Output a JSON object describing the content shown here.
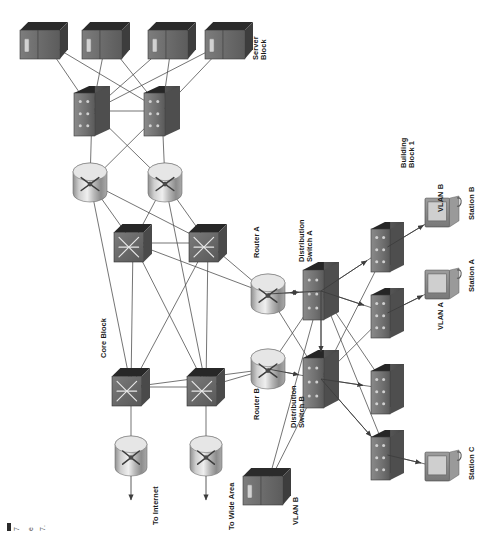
{
  "diagram": {
    "type": "network-topology",
    "orientation": "rotated-90-ccw",
    "background": "#ffffff"
  },
  "palette": {
    "device_dark": "#3f3f3f",
    "device_top": "#2a2a2a",
    "device_face": "#6e6e6e",
    "device_side": "#555555",
    "router_light": "#d8d8d8",
    "router_mid": "#9a9a9a",
    "router_dark": "#6a6a6a",
    "line": "#4a4a4a",
    "text": "#1a1a1a",
    "screen": "#c9c9c9"
  },
  "labels": [
    {
      "id": "server-block",
      "text_line1": "Server",
      "text_line2": "Block",
      "x": 252,
      "y": 60
    },
    {
      "id": "core-block",
      "text_line1": "Core Block",
      "text_line2": "",
      "x": 100,
      "y": 358
    },
    {
      "id": "to-internet",
      "text_line1": "To Internet",
      "text_line2": "",
      "x": 152,
      "y": 525
    },
    {
      "id": "to-wide-area",
      "text_line1": "To Wide Area",
      "text_line2": "",
      "x": 228,
      "y": 530
    },
    {
      "id": "router-a",
      "text_line1": "Router A",
      "text_line2": "",
      "x": 253,
      "y": 258
    },
    {
      "id": "distribution-switch-a",
      "text_line1": "Distribution",
      "text_line2": "Switch A",
      "x": 298,
      "y": 262
    },
    {
      "id": "router-b",
      "text_line1": "Router B",
      "text_line2": "",
      "x": 253,
      "y": 420
    },
    {
      "id": "distribution-switch-b",
      "text_line1": "Distribution",
      "text_line2": "Switch B",
      "x": 290,
      "y": 428
    },
    {
      "id": "building-block-1",
      "text_line1": "Building",
      "text_line2": "Block 1",
      "x": 400,
      "y": 168
    },
    {
      "id": "vlan-a",
      "text_line1": "VLAN A",
      "text_line2": "",
      "x": 437,
      "y": 330
    },
    {
      "id": "vlan-b-top",
      "text_line1": "VLAN B",
      "text_line2": "",
      "x": 437,
      "y": 212
    },
    {
      "id": "vlan-b-bottom",
      "text_line1": "VLAN B",
      "text_line2": "",
      "x": 292,
      "y": 525
    },
    {
      "id": "station-a",
      "text_line1": "Station A",
      "text_line2": "",
      "x": 468,
      "y": 292
    },
    {
      "id": "station-b",
      "text_line1": "Station B",
      "text_line2": "",
      "x": 468,
      "y": 220
    },
    {
      "id": "station-c",
      "text_line1": "Station C",
      "text_line2": "",
      "x": 468,
      "y": 480
    }
  ],
  "nodes": [
    {
      "id": "srv1",
      "kind": "server",
      "name": "server-block-server-1",
      "x": 20,
      "y": 22,
      "w": 48,
      "h": 37
    },
    {
      "id": "srv2",
      "kind": "server",
      "name": "server-block-server-2",
      "x": 82,
      "y": 22,
      "w": 48,
      "h": 37
    },
    {
      "id": "srv3",
      "kind": "server",
      "name": "server-block-server-3",
      "x": 148,
      "y": 22,
      "w": 48,
      "h": 37
    },
    {
      "id": "srv4",
      "kind": "server",
      "name": "server-block-server-4",
      "x": 205,
      "y": 22,
      "w": 48,
      "h": 37
    },
    {
      "id": "sw1",
      "kind": "switch",
      "name": "server-block-switch-1",
      "x": 74,
      "y": 86,
      "w": 36,
      "h": 50
    },
    {
      "id": "sw2",
      "kind": "switch",
      "name": "server-block-switch-2",
      "x": 144,
      "y": 86,
      "w": 36,
      "h": 50
    },
    {
      "id": "rt1",
      "kind": "router",
      "name": "server-block-router-1",
      "x": 73,
      "y": 163,
      "w": 34,
      "h": 39
    },
    {
      "id": "rt2",
      "kind": "router",
      "name": "server-block-router-2",
      "x": 148,
      "y": 163,
      "w": 34,
      "h": 39
    },
    {
      "id": "cs1",
      "kind": "coreswitch",
      "name": "core-switch-1",
      "x": 114,
      "y": 224,
      "w": 38,
      "h": 38
    },
    {
      "id": "cs2",
      "kind": "coreswitch",
      "name": "core-switch-2",
      "x": 189,
      "y": 224,
      "w": 38,
      "h": 38
    },
    {
      "id": "cs3",
      "kind": "coreswitch",
      "name": "core-switch-3",
      "x": 112,
      "y": 368,
      "w": 38,
      "h": 38
    },
    {
      "id": "cs4",
      "kind": "coreswitch",
      "name": "core-switch-4",
      "x": 187,
      "y": 368,
      "w": 38,
      "h": 38
    },
    {
      "id": "er1",
      "kind": "router",
      "name": "edge-router-internet",
      "x": 115,
      "y": 436,
      "w": 32,
      "h": 40
    },
    {
      "id": "er2",
      "kind": "router",
      "name": "edge-router-wide-area",
      "x": 190,
      "y": 436,
      "w": 32,
      "h": 40
    },
    {
      "id": "ra",
      "kind": "router",
      "name": "router-a",
      "x": 251,
      "y": 274,
      "w": 34,
      "h": 40
    },
    {
      "id": "rb",
      "kind": "router",
      "name": "router-b",
      "x": 251,
      "y": 349,
      "w": 34,
      "h": 40
    },
    {
      "id": "dsa",
      "kind": "switch",
      "name": "distribution-switch-a",
      "x": 303,
      "y": 262,
      "w": 36,
      "h": 58
    },
    {
      "id": "dsb",
      "kind": "switch",
      "name": "distribution-switch-b",
      "x": 303,
      "y": 350,
      "w": 36,
      "h": 58
    },
    {
      "id": "as1",
      "kind": "switch",
      "name": "access-switch-1",
      "x": 371,
      "y": 222,
      "w": 33,
      "h": 50
    },
    {
      "id": "as2",
      "kind": "switch",
      "name": "access-switch-2",
      "x": 371,
      "y": 288,
      "w": 33,
      "h": 50
    },
    {
      "id": "as3",
      "kind": "switch",
      "name": "access-switch-3",
      "x": 371,
      "y": 364,
      "w": 33,
      "h": 50
    },
    {
      "id": "as4",
      "kind": "switch",
      "name": "access-switch-4",
      "x": 371,
      "y": 430,
      "w": 33,
      "h": 50
    },
    {
      "id": "stA",
      "kind": "station",
      "name": "station-a",
      "x": 425,
      "y": 268,
      "w": 34,
      "h": 36
    },
    {
      "id": "stB",
      "kind": "station",
      "name": "station-b",
      "x": 425,
      "y": 196,
      "w": 34,
      "h": 36
    },
    {
      "id": "stC",
      "kind": "station",
      "name": "station-c",
      "x": 425,
      "y": 450,
      "w": 34,
      "h": 36
    },
    {
      "id": "vsrv",
      "kind": "server",
      "name": "vlan-b-server",
      "x": 243,
      "y": 468,
      "w": 48,
      "h": 37
    }
  ],
  "links": [
    {
      "from": "srv1",
      "to": "sw1"
    },
    {
      "from": "srv1",
      "to": "sw2"
    },
    {
      "from": "srv2",
      "to": "sw1"
    },
    {
      "from": "srv2",
      "to": "sw2"
    },
    {
      "from": "srv3",
      "to": "sw1"
    },
    {
      "from": "srv3",
      "to": "sw2"
    },
    {
      "from": "srv4",
      "to": "sw1"
    },
    {
      "from": "srv4",
      "to": "sw2"
    },
    {
      "from": "sw1",
      "to": "sw2"
    },
    {
      "from": "sw1",
      "to": "rt1"
    },
    {
      "from": "sw1",
      "to": "rt2"
    },
    {
      "from": "sw2",
      "to": "rt1"
    },
    {
      "from": "sw2",
      "to": "rt2"
    },
    {
      "from": "rt1",
      "to": "cs1"
    },
    {
      "from": "rt1",
      "to": "cs2"
    },
    {
      "from": "rt2",
      "to": "cs1"
    },
    {
      "from": "rt2",
      "to": "cs2"
    },
    {
      "from": "rt1",
      "to": "cs3"
    },
    {
      "from": "rt2",
      "to": "cs4"
    },
    {
      "from": "cs1",
      "to": "cs2"
    },
    {
      "from": "cs3",
      "to": "cs4"
    },
    {
      "from": "cs1",
      "to": "cs3"
    },
    {
      "from": "cs1",
      "to": "cs4"
    },
    {
      "from": "cs2",
      "to": "cs3"
    },
    {
      "from": "cs2",
      "to": "cs4"
    },
    {
      "from": "cs3",
      "to": "er1"
    },
    {
      "from": "cs4",
      "to": "er2"
    },
    {
      "from": "cs1",
      "to": "ra"
    },
    {
      "from": "cs2",
      "to": "ra"
    },
    {
      "from": "cs3",
      "to": "rb"
    },
    {
      "from": "cs4",
      "to": "rb"
    },
    {
      "from": "ra",
      "to": "dsa"
    },
    {
      "from": "rb",
      "to": "dsb"
    },
    {
      "from": "ra",
      "to": "dsb"
    },
    {
      "from": "rb",
      "to": "dsa"
    },
    {
      "from": "dsa",
      "to": "dsb"
    },
    {
      "from": "dsa",
      "to": "as1"
    },
    {
      "from": "dsa",
      "to": "as2"
    },
    {
      "from": "dsa",
      "to": "as3"
    },
    {
      "from": "dsa",
      "to": "as4"
    },
    {
      "from": "dsb",
      "to": "as1"
    },
    {
      "from": "dsb",
      "to": "as2"
    },
    {
      "from": "dsb",
      "to": "as3"
    },
    {
      "from": "dsb",
      "to": "as4"
    },
    {
      "from": "as1",
      "to": "stB"
    },
    {
      "from": "as2",
      "to": "stA"
    },
    {
      "from": "as4",
      "to": "stC"
    },
    {
      "from": "vsrv",
      "to": "dsa"
    },
    {
      "from": "vsrv",
      "to": "dsb"
    }
  ],
  "arrows": [
    {
      "id": "to-internet-arrow",
      "x1": 131,
      "y1": 476,
      "x2": 131,
      "y2": 500
    },
    {
      "id": "to-wide-area-arrow",
      "x1": 206,
      "y1": 476,
      "x2": 206,
      "y2": 500
    }
  ],
  "corner_marks": {
    "glyph_1": "7",
    "glyph_2": "e",
    "glyph_3": "7."
  }
}
